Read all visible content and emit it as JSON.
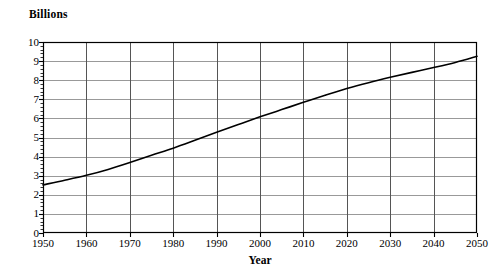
{
  "chart_data": {
    "type": "line",
    "title": "",
    "subtitle": "",
    "unit_caption": "Billions",
    "xlabel": "Year",
    "ylabel": "Billions",
    "xlim": [
      1950,
      2050
    ],
    "ylim": [
      0,
      10
    ],
    "grid": true,
    "legend": "none",
    "x_tick_labels": [
      "1950",
      "1960",
      "1970",
      "1980",
      "1990",
      "2000",
      "2010",
      "2020",
      "2030",
      "2040",
      "2050"
    ],
    "y_tick_labels": [
      "10",
      "9",
      "8",
      "7",
      "6",
      "5",
      "4",
      "3",
      "2",
      "1",
      "0"
    ],
    "x_ticks": [
      1950,
      1960,
      1970,
      1980,
      1990,
      2000,
      2010,
      2020,
      2030,
      2040,
      2050
    ],
    "y_ticks": [
      0,
      1,
      2,
      3,
      4,
      5,
      6,
      7,
      8,
      9,
      10
    ],
    "y_minor_tick_step": 0.2,
    "series": [
      {
        "name": "World population",
        "color": "#000000",
        "x": [
          1950,
          1955,
          1960,
          1965,
          1970,
          1975,
          1980,
          1985,
          1990,
          1995,
          2000,
          2005,
          2010,
          2015,
          2020,
          2025,
          2030,
          2035,
          2040,
          2045,
          2050
        ],
        "values": [
          2.52,
          2.76,
          3.02,
          3.33,
          3.69,
          4.07,
          4.44,
          4.85,
          5.27,
          5.68,
          6.08,
          6.46,
          6.84,
          7.21,
          7.56,
          7.87,
          8.15,
          8.41,
          8.66,
          8.93,
          9.25
        ]
      }
    ]
  },
  "axes": {
    "unit_caption": "Billions",
    "x_title": "Year"
  }
}
